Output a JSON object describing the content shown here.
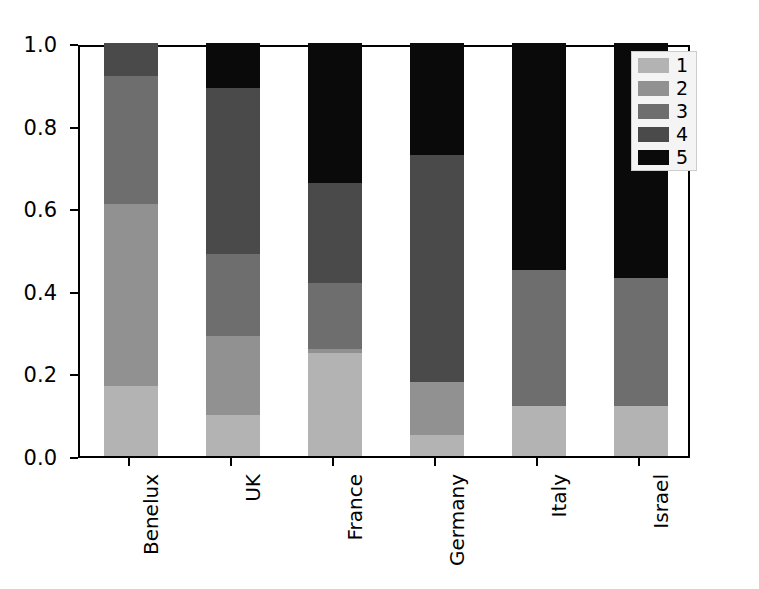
{
  "chart_data": {
    "type": "bar",
    "subtype": "stacked-bar-normalized",
    "title": "",
    "xlabel": "",
    "ylabel": "",
    "ylim": [
      0.0,
      1.0
    ],
    "yticks": [
      "0.0",
      "0.2",
      "0.4",
      "0.6",
      "0.8",
      "1.0"
    ],
    "ytick_values": [
      0.0,
      0.2,
      0.4,
      0.6,
      0.8,
      1.0
    ],
    "grid": false,
    "legend_position": "upper right",
    "legend_title": "",
    "categories": [
      "Benelux",
      "UK",
      "France",
      "Germany",
      "Italy",
      "Israel"
    ],
    "series": [
      {
        "name": "1",
        "color": "#b3b3b3",
        "values": [
          0.17,
          0.1,
          0.25,
          0.05,
          0.12,
          0.12
        ]
      },
      {
        "name": "2",
        "color": "#919191",
        "values": [
          0.44,
          0.19,
          0.01,
          0.13,
          0.0,
          0.0
        ]
      },
      {
        "name": "3",
        "color": "#6e6e6e",
        "values": [
          0.31,
          0.2,
          0.16,
          0.0,
          0.33,
          0.31
        ]
      },
      {
        "name": "4",
        "color": "#4a4a4a",
        "values": [
          0.08,
          0.4,
          0.24,
          0.55,
          0.0,
          0.0
        ]
      },
      {
        "name": "5",
        "color": "#0a0a0a",
        "values": [
          0.0,
          0.11,
          0.34,
          0.27,
          0.55,
          0.57
        ]
      }
    ]
  },
  "axes": {
    "plot_left_px": 78,
    "plot_top_px": 45,
    "plot_width_px": 612,
    "plot_height_px": 413
  },
  "legend": {
    "entries": [
      {
        "label": "1",
        "color": "#b3b3b3"
      },
      {
        "label": "2",
        "color": "#919191"
      },
      {
        "label": "3",
        "color": "#6e6e6e"
      },
      {
        "label": "4",
        "color": "#4a4a4a"
      },
      {
        "label": "5",
        "color": "#0a0a0a"
      }
    ]
  },
  "style": {
    "background": "#ffffff",
    "axis_color": "#000000",
    "legend_face": "#f4f4f4",
    "legend_edge": "#cccccc"
  }
}
